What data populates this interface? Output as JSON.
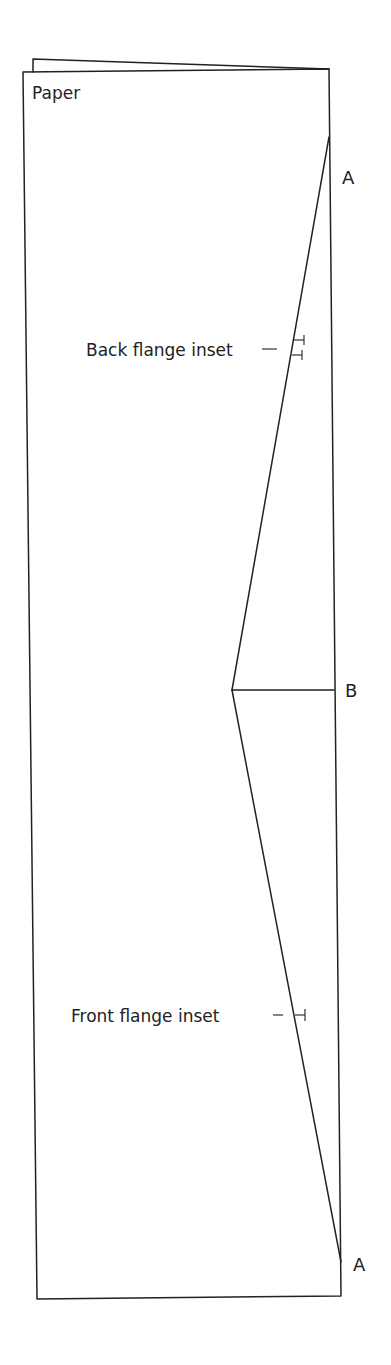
{
  "diagram": {
    "title_label": "Paper",
    "points": {
      "top": "A",
      "middle": "B",
      "bottom": "A"
    },
    "annotations": {
      "back": "Back flange inset",
      "front": "Front flange inset"
    },
    "stroke_color": "#222222",
    "background": "#ffffff"
  }
}
